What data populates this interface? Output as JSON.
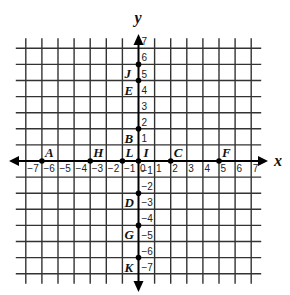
{
  "diagram": {
    "type": "coordinate-plane",
    "axes": {
      "x_label": "x",
      "y_label": "y",
      "x_range": [
        -7,
        7
      ],
      "y_range": [
        -7,
        7
      ],
      "x_ticks": [
        "-7",
        "-6",
        "-5",
        "-4",
        "-3",
        "-2",
        "-1",
        "0",
        "1",
        "2",
        "3",
        "4",
        "5",
        "6",
        "7"
      ],
      "y_ticks": [
        "7",
        "6",
        "5",
        "4",
        "3",
        "2",
        "1",
        "-1",
        "-2",
        "-3",
        "-4",
        "-5",
        "-6",
        "-7"
      ]
    },
    "points": [
      {
        "label": "A",
        "x": -6,
        "y": 0
      },
      {
        "label": "H",
        "x": -3,
        "y": 0
      },
      {
        "label": "L",
        "x": -1,
        "y": 0
      },
      {
        "label": "I",
        "x": 0,
        "y": 0
      },
      {
        "label": "C",
        "x": 2,
        "y": 0
      },
      {
        "label": "F",
        "x": 5,
        "y": 0
      },
      {
        "label": "J",
        "x": 0,
        "y": 6
      },
      {
        "label": "E",
        "x": 0,
        "y": 5
      },
      {
        "label": "B",
        "x": 0,
        "y": 2
      },
      {
        "label": "D",
        "x": 0,
        "y": -2
      },
      {
        "label": "G",
        "x": 0,
        "y": -4
      },
      {
        "label": "K",
        "x": 0,
        "y": -6
      }
    ],
    "colors": {
      "grid": "#333333",
      "axis": "#000000",
      "point": "#000000",
      "background": "#ffffff"
    }
  }
}
